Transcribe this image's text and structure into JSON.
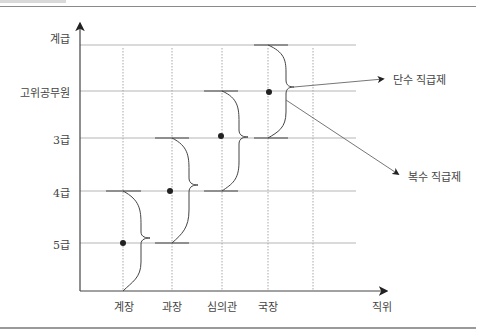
{
  "diagram": {
    "y_axis_label": "계급",
    "x_axis_label": "직위",
    "y_levels": [
      "고위공무원",
      "3급",
      "4급",
      "5급"
    ],
    "x_positions": [
      "계장",
      "과장",
      "심의관",
      "국장"
    ],
    "annotations": {
      "single": "단수 직급제",
      "multiple": "복수 직급제"
    },
    "nodes": [
      {
        "position": "계장",
        "grade": "5급",
        "range": [
          "4급",
          "below 5급"
        ]
      },
      {
        "position": "과장",
        "grade": "between 4급 and 3급",
        "range": [
          "3급",
          "5급"
        ]
      },
      {
        "position": "심의관",
        "grade": "3급+",
        "range": [
          "고위공무원",
          "4급"
        ]
      },
      {
        "position": "국장",
        "grade": "고위공무원",
        "range": [
          "top",
          "3급"
        ]
      }
    ],
    "colors": {
      "line": "#555555",
      "grid": "#b0b0b0",
      "dot": "#222222"
    }
  }
}
